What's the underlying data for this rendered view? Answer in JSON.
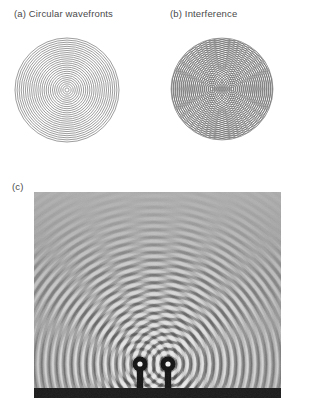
{
  "figure": {
    "caption_a": "(a) Circular wavefronts",
    "caption_b": "(b) Interference",
    "caption_c": "(c)"
  },
  "chart_data": {
    "type": "diagram",
    "panels": [
      {
        "id": "a",
        "label": "(a) Circular wavefronts",
        "kind": "concentric-circles",
        "description": "Single point source emitting circular wavefronts",
        "source_count": 1,
        "center": {
          "x": 53,
          "y": 53
        },
        "outer_radius": 52,
        "ring_count": 25,
        "ring_spacing": 2.08,
        "stroke_color": "#8b8b8b"
      },
      {
        "id": "b",
        "label": "(b) Interference",
        "kind": "two-source-moire",
        "description": "Two overlapping circular wave trains forming radial interference fringes",
        "source_count": 2,
        "centers": [
          {
            "x": 42,
            "y": 52
          },
          {
            "x": 62,
            "y": 52
          }
        ],
        "clip_center": {
          "x": 52,
          "y": 52
        },
        "clip_radius": 51,
        "outer_radius": 78,
        "ring_count": 40,
        "ring_spacing": 1.95,
        "stroke_color": "#6e6e6e"
      },
      {
        "id": "c",
        "label": "(c)",
        "kind": "photograph",
        "description": "Ripple tank photograph of two point sources producing an interference pattern",
        "source_count": 2,
        "sources": [
          {
            "x": 106,
            "y": 172
          },
          {
            "x": 134,
            "y": 172
          }
        ],
        "wavelength_px": 7.5,
        "bounds": {
          "x": 34,
          "y": 192,
          "width": 247,
          "height": 206
        },
        "background_gray": "#9a9a9a",
        "bottom_bar": {
          "y": 196,
          "height": 10,
          "color": "#1a1a1a"
        }
      }
    ]
  },
  "colors": {
    "page_background": "#ffffff",
    "label_text": "#4a4a4a",
    "wavefront_stroke_a": "#8b8b8b",
    "wavefront_stroke_b": "#6e6e6e",
    "photo_base": "#9a9a9a",
    "photo_bar": "#1a1a1a"
  }
}
